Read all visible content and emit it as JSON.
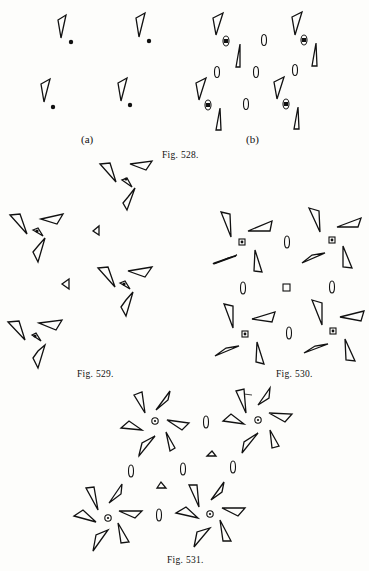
{
  "figures": [
    {
      "id": "fig528",
      "caption": "Fig. 528.",
      "sub_labels": [
        "(a)",
        "(b)"
      ]
    },
    {
      "id": "fig529",
      "caption": "Fig. 529."
    },
    {
      "id": "fig530",
      "caption": "Fig. 530."
    },
    {
      "id": "fig531",
      "caption": "Fig. 531."
    }
  ],
  "colors": {
    "ink": "#111111",
    "paper": "#fdfdfb"
  }
}
